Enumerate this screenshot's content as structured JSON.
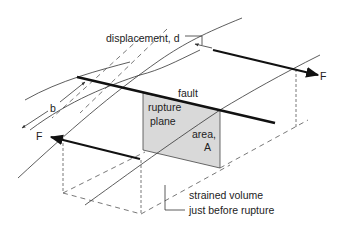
{
  "diagram": {
    "labels": {
      "displacement": "displacement, d",
      "fault": "fault",
      "rupture_plane_line1": "rupture",
      "rupture_plane_line2": "plane",
      "area_line1": "area,",
      "area_line2": "A",
      "width": "b",
      "force_right": "F",
      "force_left": "F",
      "strained_line1": "strained volume",
      "strained_line2": "just before rupture"
    },
    "colors": {
      "plane_fill": "#d9d9d9",
      "line": "#111111"
    }
  }
}
